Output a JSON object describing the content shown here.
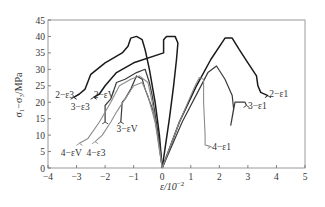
{
  "chart_data": {
    "type": "line",
    "title": "",
    "xlabel": "ε/10⁻²",
    "ylabel": "σ₁−σ₃/MPa",
    "xlim": [
      -4,
      5
    ],
    "ylim": [
      0,
      45
    ],
    "x_ticks": [
      -4,
      -3,
      -2,
      -1,
      0,
      1,
      2,
      3,
      4,
      5
    ],
    "y_ticks": [
      0,
      5,
      10,
      15,
      20,
      25,
      30,
      35,
      40,
      45
    ],
    "grid": false,
    "legend": "inline labels",
    "series": [
      {
        "name": "2−ε1",
        "group": "2",
        "color": "#1a1a1a",
        "width": 1.5,
        "points": [
          [
            0,
            0
          ],
          [
            0.6,
            14
          ],
          [
            1.2,
            25
          ],
          [
            1.7,
            33
          ],
          [
            2.2,
            39.5
          ],
          [
            2.45,
            39.5
          ],
          [
            2.7,
            36
          ],
          [
            3.0,
            32
          ],
          [
            3.3,
            28
          ],
          [
            3.35,
            25
          ],
          [
            3.45,
            23
          ],
          [
            3.7,
            22
          ]
        ]
      },
      {
        "name": "2−εV",
        "group": "2",
        "color": "#1a1a1a",
        "width": 1.5,
        "points": [
          [
            0,
            0
          ],
          [
            0.25,
            15
          ],
          [
            0.4,
            25
          ],
          [
            0.5,
            33
          ],
          [
            0.55,
            38
          ],
          [
            0.45,
            40
          ],
          [
            0.15,
            40
          ],
          [
            0.05,
            39
          ],
          [
            0.05,
            35
          ],
          [
            -1.0,
            32
          ],
          [
            -1.6,
            29
          ],
          [
            -2.0,
            25
          ],
          [
            -2.2,
            22.5
          ],
          [
            -2.4,
            21.5
          ]
        ]
      },
      {
        "name": "2−ε3",
        "group": "2",
        "color": "#1a1a1a",
        "width": 1.5,
        "points": [
          [
            0,
            0
          ],
          [
            -0.1,
            10
          ],
          [
            -0.25,
            20
          ],
          [
            -0.45,
            30
          ],
          [
            -0.6,
            36
          ],
          [
            -0.7,
            39
          ],
          [
            -0.9,
            40
          ],
          [
            -1.1,
            39.5
          ],
          [
            -1.2,
            37
          ],
          [
            -1.4,
            35
          ],
          [
            -2.0,
            32
          ],
          [
            -2.5,
            28.5
          ],
          [
            -2.7,
            24
          ],
          [
            -2.9,
            22.5
          ],
          [
            -3.1,
            21.5
          ]
        ]
      },
      {
        "name": "3−ε1",
        "group": "3",
        "color": "#3a3a3a",
        "width": 1.2,
        "points": [
          [
            0,
            0
          ],
          [
            0.7,
            14
          ],
          [
            1.3,
            24
          ],
          [
            1.6,
            29
          ],
          [
            1.9,
            31
          ],
          [
            2.2,
            27
          ],
          [
            2.45,
            22
          ],
          [
            2.5,
            18
          ],
          [
            2.4,
            13
          ],
          [
            2.55,
            20
          ],
          [
            2.9,
            20
          ],
          [
            2.95,
            19
          ]
        ]
      },
      {
        "name": "3−εV",
        "group": "3",
        "color": "#3a3a3a",
        "width": 1.2,
        "points": [
          [
            0,
            0
          ],
          [
            -0.15,
            10
          ],
          [
            -0.3,
            17
          ],
          [
            -0.6,
            24
          ],
          [
            -0.7,
            27
          ],
          [
            -0.9,
            28
          ],
          [
            -1.1,
            24
          ],
          [
            -1.3,
            21
          ],
          [
            -1.4,
            20
          ],
          [
            -1.45,
            14
          ]
        ]
      },
      {
        "name": "3−ε3",
        "group": "3",
        "color": "#3a3a3a",
        "width": 1.2,
        "points": [
          [
            0,
            0
          ],
          [
            -0.1,
            8
          ],
          [
            -0.35,
            22
          ],
          [
            -0.45,
            26
          ],
          [
            -0.6,
            30
          ],
          [
            -0.9,
            29
          ],
          [
            -1.3,
            27
          ],
          [
            -1.6,
            26
          ],
          [
            -1.8,
            21
          ],
          [
            -1.9,
            20
          ],
          [
            -2.0,
            19
          ],
          [
            -2.0,
            14
          ]
        ]
      },
      {
        "name": "4−ε1",
        "group": "4",
        "color": "#8c8c8c",
        "width": 1.1,
        "points": [
          [
            0,
            0
          ],
          [
            0.6,
            14
          ],
          [
            1.1,
            24
          ],
          [
            1.3,
            27.5
          ],
          [
            1.45,
            27
          ],
          [
            1.45,
            20
          ],
          [
            1.5,
            10
          ],
          [
            1.5,
            7
          ],
          [
            1.7,
            6.5
          ]
        ]
      },
      {
        "name": "4−εV",
        "group": "4",
        "color": "#8c8c8c",
        "width": 1.1,
        "points": [
          [
            0,
            0
          ],
          [
            -0.2,
            12
          ],
          [
            -0.35,
            20
          ],
          [
            -0.5,
            26
          ],
          [
            -0.8,
            28
          ],
          [
            -1.1,
            27
          ],
          [
            -1.5,
            25
          ],
          [
            -1.8,
            20
          ],
          [
            -2.2,
            14
          ],
          [
            -2.6,
            9
          ],
          [
            -2.9,
            7.5
          ]
        ]
      },
      {
        "name": "4−ε3",
        "group": "4",
        "color": "#8c8c8c",
        "width": 1.1,
        "points": [
          [
            0,
            0
          ],
          [
            -0.25,
            14
          ],
          [
            -0.5,
            22
          ],
          [
            -0.7,
            26
          ],
          [
            -1.0,
            25
          ],
          [
            -1.3,
            21
          ],
          [
            -1.6,
            17
          ],
          [
            -1.8,
            14
          ],
          [
            -2.1,
            10
          ],
          [
            -2.35,
            8
          ]
        ]
      }
    ],
    "annotations": [
      {
        "text": "2−ε1",
        "x": 3.75,
        "y": 21.5
      },
      {
        "text": "2−εV",
        "x": -2.4,
        "y": 21.3
      },
      {
        "text": "2−ε3",
        "x": -3.75,
        "y": 21.3
      },
      {
        "text": "3−ε1",
        "x": 3.0,
        "y": 18.0
      },
      {
        "text": "3−εV",
        "x": -1.6,
        "y": 11.0
      },
      {
        "text": "3−ε3",
        "x": -3.2,
        "y": 17.5
      },
      {
        "text": "4−ε1",
        "x": 1.75,
        "y": 5.5
      },
      {
        "text": "4−εV",
        "x": -3.55,
        "y": 3.5
      },
      {
        "text": "4−ε3",
        "x": -2.65,
        "y": 3.5
      }
    ]
  },
  "plot_area": {
    "left": 48,
    "right": 305,
    "top": 20,
    "bottom": 168
  },
  "axes": {
    "x_title": "ε/10",
    "x_title_exp": "−2",
    "y_title": "σ₁−σ₃/MPa"
  }
}
